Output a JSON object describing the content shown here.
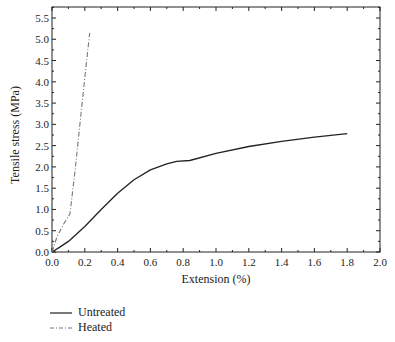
{
  "chart_data": {
    "type": "line",
    "title": "",
    "xlabel": "Extension (%)",
    "ylabel": "Tensile stress (MPa)",
    "xlim": [
      0.0,
      2.0
    ],
    "ylim": [
      0.0,
      5.75
    ],
    "xticks": [
      "0.0",
      "0.2",
      "0.4",
      "0.6",
      "0.8",
      "1.0",
      "1.2",
      "1.4",
      "1.6",
      "1.8",
      "2.0"
    ],
    "yticks": [
      "0.0",
      "0.5",
      "1.0",
      "1.5",
      "2.0",
      "2.5",
      "3.0",
      "3.5",
      "4.0",
      "4.5",
      "5.0",
      "5.5"
    ],
    "grid": false,
    "legend_position": "below-left",
    "series": [
      {
        "name": "Untreated",
        "style": "solid",
        "color": "#222222",
        "x": [
          0.0,
          0.05,
          0.1,
          0.15,
          0.2,
          0.3,
          0.4,
          0.5,
          0.6,
          0.7,
          0.76,
          0.84,
          1.0,
          1.2,
          1.4,
          1.6,
          1.8
        ],
        "y": [
          0.0,
          0.12,
          0.25,
          0.42,
          0.6,
          1.0,
          1.38,
          1.7,
          1.93,
          2.07,
          2.13,
          2.15,
          2.32,
          2.48,
          2.6,
          2.7,
          2.78
        ]
      },
      {
        "name": "Heated",
        "style": "dash-dot",
        "color": "#777777",
        "x": [
          0.0,
          0.03,
          0.07,
          0.11,
          0.14,
          0.17,
          0.2,
          0.23
        ],
        "y": [
          0.0,
          0.35,
          0.65,
          0.9,
          1.9,
          3.0,
          4.1,
          5.15
        ]
      }
    ]
  },
  "legend": {
    "items": [
      {
        "label": "Untreated",
        "style": "solid"
      },
      {
        "label": "Heated",
        "style": "dash-dot"
      }
    ]
  }
}
